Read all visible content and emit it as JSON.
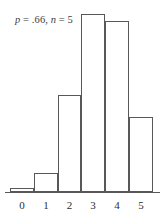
{
  "figure": {
    "title_parts": {
      "p_symbol": "p",
      "p_equals_value": " = .66, ",
      "n_symbol": "n",
      "n_equals_value": " = 5"
    },
    "title_full": "p = .66, n = 5",
    "line_color": "#585858",
    "fill_color": "#ffffff",
    "text_color": "#2e2e2e",
    "background": "#ffffff"
  },
  "chart_data": {
    "type": "bar",
    "title": "p = .66, n = 5",
    "subtitle": "",
    "xlabel": "",
    "ylabel": "",
    "categories": [
      "0",
      "1",
      "2",
      "3",
      "4",
      "5"
    ],
    "values": [
      0.0045,
      0.0435,
      0.1691,
      0.328,
      0.3182,
      0.1235
    ],
    "tick_labels": [
      "0",
      "1",
      "2",
      "3",
      "4",
      "5"
    ],
    "bar_pixel_heights": [
      4,
      19,
      97,
      178,
      171,
      75
    ],
    "bar_left_edges": [
      10,
      34,
      58,
      81,
      105,
      129
    ],
    "bar_right_edges": [
      34,
      58,
      81,
      105,
      129,
      153
    ],
    "baseline_y": 192,
    "xlim": [
      -0.5,
      5.5
    ],
    "ylim": [
      0,
      0.354
    ],
    "grid": false,
    "legend": null,
    "distribution": "binomial",
    "parameters": {
      "p": 0.66,
      "n": 5
    }
  }
}
